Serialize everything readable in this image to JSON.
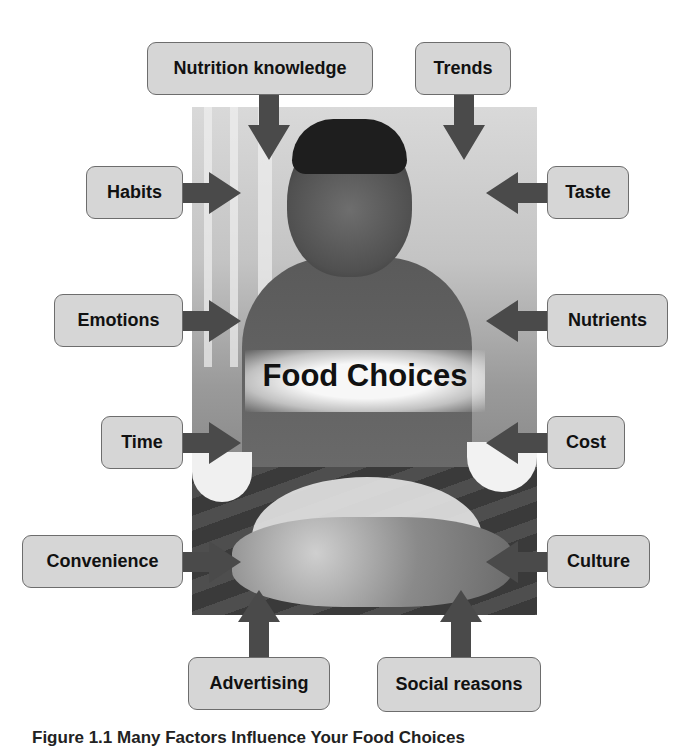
{
  "diagram": {
    "center_label": "Food Choices",
    "arrow_color": "#4a4a4a",
    "box_fill": "#d6d6d6",
    "factors": {
      "nutrition_knowledge": "Nutrition knowledge",
      "trends": "Trends",
      "habits": "Habits",
      "taste": "Taste",
      "emotions": "Emotions",
      "nutrients": "Nutrients",
      "time": "Time",
      "cost": "Cost",
      "convenience": "Convenience",
      "culture": "Culture",
      "advertising": "Advertising",
      "social_reasons": "Social reasons"
    }
  },
  "caption": "Figure 1.1  Many Factors Influence Your Food Choices"
}
